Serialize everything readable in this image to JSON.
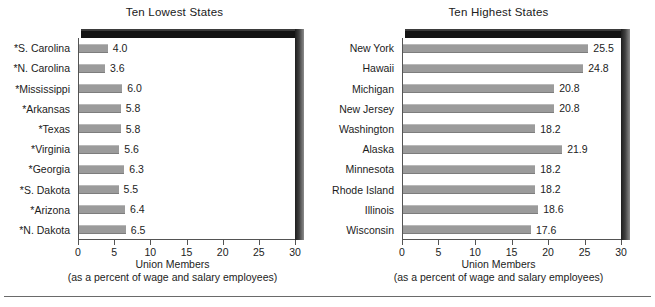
{
  "chart_data": [
    {
      "type": "bar",
      "orientation": "horizontal",
      "title": "Ten Lowest States",
      "xlabel": "Union Members",
      "xlabel_sub": "(as a percent of wage and salary employees)",
      "ylabel": "",
      "xlim": [
        0,
        30
      ],
      "xticks": [
        0,
        5,
        10,
        15,
        20,
        25,
        30
      ],
      "xticklabels": [
        "0",
        "5",
        "10",
        "15",
        "20",
        "25",
        "30"
      ],
      "grid": false,
      "legend": false,
      "bar_color": "#9b9b9b",
      "categories": [
        "*S. Carolina",
        "*N. Carolina",
        "*Mississippi",
        "*Arkansas",
        "*Texas",
        "*Virginia",
        "*Georgia",
        "*S. Dakota",
        "*Arizona",
        "*N. Dakota"
      ],
      "values": [
        4.0,
        3.6,
        6.0,
        5.8,
        5.8,
        5.6,
        6.3,
        5.5,
        6.4,
        6.5
      ],
      "data_labels": [
        "4.0",
        "3.6",
        "6.0",
        "5.8",
        "5.8",
        "5.6",
        "6.3",
        "5.5",
        "6.4",
        "6.5"
      ]
    },
    {
      "type": "bar",
      "orientation": "horizontal",
      "title": "Ten Highest States",
      "xlabel": "Union Members",
      "xlabel_sub": "(as a percent of wage and salary employees)",
      "ylabel": "",
      "xlim": [
        0,
        30
      ],
      "xticks": [
        0,
        5,
        10,
        15,
        20,
        25,
        30
      ],
      "xticklabels": [
        "0",
        "5",
        "10",
        "15",
        "20",
        "25",
        "30"
      ],
      "grid": false,
      "legend": false,
      "bar_color": "#9b9b9b",
      "categories": [
        "New York",
        "Hawaii",
        "Michigan",
        "New Jersey",
        "Washington",
        "Alaska",
        "Minnesota",
        "Rhode Island",
        "Illinois",
        "Wisconsin"
      ],
      "values": [
        25.5,
        24.8,
        20.8,
        20.8,
        18.2,
        21.9,
        18.2,
        18.2,
        18.6,
        17.6
      ],
      "data_labels": [
        "25.5",
        "24.8",
        "20.8",
        "20.8",
        "18.2",
        "21.9",
        "18.2",
        "18.2",
        "18.6",
        "17.6"
      ]
    }
  ]
}
